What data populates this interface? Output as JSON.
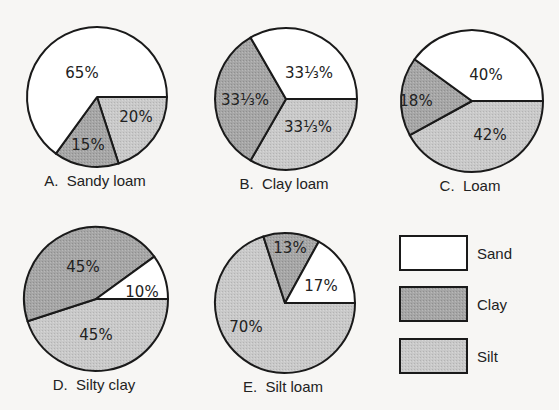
{
  "chart_data": {
    "type": "pie",
    "title": "",
    "legend": {
      "position": "right-bottom",
      "entries": [
        {
          "name": "Sand",
          "color": "#ffffff"
        },
        {
          "name": "Clay",
          "color": "#a9a9a9"
        },
        {
          "name": "Silt",
          "color": "#c8c8c8"
        }
      ]
    },
    "pies": [
      {
        "id": "A",
        "caption": "A.  Sandy loam",
        "cx": 97,
        "cy": 97,
        "r": 70,
        "slices": [
          {
            "name": "Silt",
            "value": 20,
            "label": "20%",
            "lx": 136,
            "ly": 122
          },
          {
            "name": "Clay",
            "value": 15,
            "label": "15%",
            "lx": 88,
            "ly": 150
          },
          {
            "name": "Sand",
            "value": 65,
            "label": "65%",
            "lx": 82,
            "ly": 78
          }
        ]
      },
      {
        "id": "B",
        "caption": "B.  Clay loam",
        "cx": 286,
        "cy": 99,
        "r": 71,
        "slices": [
          {
            "name": "Silt",
            "value": 33.333,
            "label": "33⅓%",
            "lx": 308,
            "ly": 132
          },
          {
            "name": "Clay",
            "value": 33.333,
            "label": "33⅓%",
            "lx": 245,
            "ly": 105
          },
          {
            "name": "Sand",
            "value": 33.333,
            "label": "33⅓%",
            "lx": 309,
            "ly": 78
          }
        ]
      },
      {
        "id": "C",
        "caption": "C.  Loam",
        "cx": 472,
        "cy": 101,
        "r": 71,
        "slices": [
          {
            "name": "Silt",
            "value": 42,
            "label": "42%",
            "lx": 490,
            "ly": 140
          },
          {
            "name": "Clay",
            "value": 18,
            "label": "18%",
            "lx": 416,
            "ly": 106
          },
          {
            "name": "Sand",
            "value": 40,
            "label": "40%",
            "lx": 486,
            "ly": 80
          }
        ]
      },
      {
        "id": "D",
        "caption": "D.  Silty clay",
        "cx": 96,
        "cy": 299,
        "r": 72,
        "slices": [
          {
            "name": "Silt",
            "value": 45,
            "label": "45%",
            "lx": 96,
            "ly": 340
          },
          {
            "name": "Clay",
            "value": 45,
            "label": "45%",
            "lx": 83,
            "ly": 272
          },
          {
            "name": "Sand",
            "value": 10,
            "label": "10%",
            "lx": 142,
            "ly": 297
          }
        ]
      },
      {
        "id": "E",
        "caption": "E.  Silt loam",
        "cx": 285,
        "cy": 303,
        "r": 70,
        "slices": [
          {
            "name": "Silt",
            "value": 70,
            "label": "70%",
            "lx": 246,
            "ly": 332
          },
          {
            "name": "Clay",
            "value": 13,
            "label": "13%",
            "lx": 290,
            "ly": 253
          },
          {
            "name": "Sand",
            "value": 17,
            "label": "17%",
            "lx": 321,
            "ly": 291
          }
        ]
      }
    ],
    "slice_order_note": "slices drawn clockwise from 3 o'clock: Silt, Clay, Sand"
  }
}
